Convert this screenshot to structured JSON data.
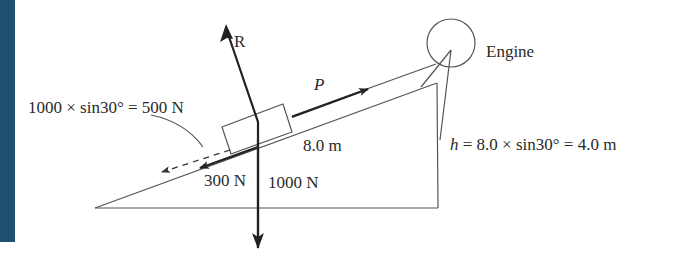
{
  "diagram": {
    "labels": {
      "reaction": "R",
      "pull_force": "P",
      "engine": "Engine",
      "slope_length": "8.0 m",
      "gravity_component": "1000 × sin30° = 500 N",
      "friction": "300 N",
      "weight": "1000 N",
      "height_var": "h",
      "height_formula": " = 8.0 × sin30° = 4.0 m"
    },
    "values": {
      "incline_angle_deg": 30,
      "slope_length_m": 8.0,
      "height_m": 4.0,
      "weight_N": 1000,
      "gravity_component_N": 500,
      "friction_N": 300
    },
    "colors": {
      "accent_stripe": "#1f4f6e",
      "ink": "#222222"
    }
  }
}
